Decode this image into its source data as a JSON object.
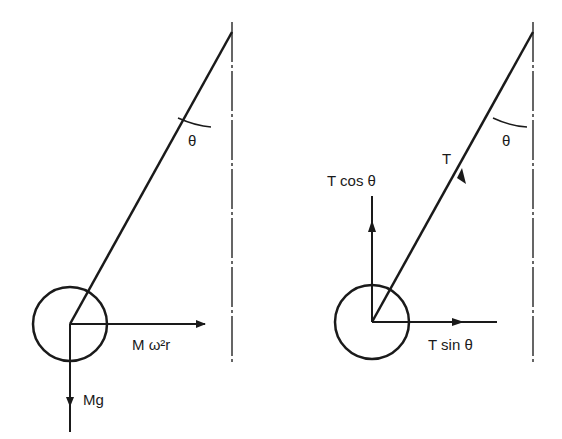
{
  "left_diagram": {
    "angle_label": "θ",
    "force_horizontal": "M ω²r",
    "force_down": "Mg"
  },
  "right_diagram": {
    "angle_label": "θ",
    "tension": "T",
    "tension_vertical": "T cos θ",
    "tension_horizontal": "T sin θ"
  },
  "colors": {
    "ink": "#1a1a1a",
    "background": "#ffffff"
  }
}
